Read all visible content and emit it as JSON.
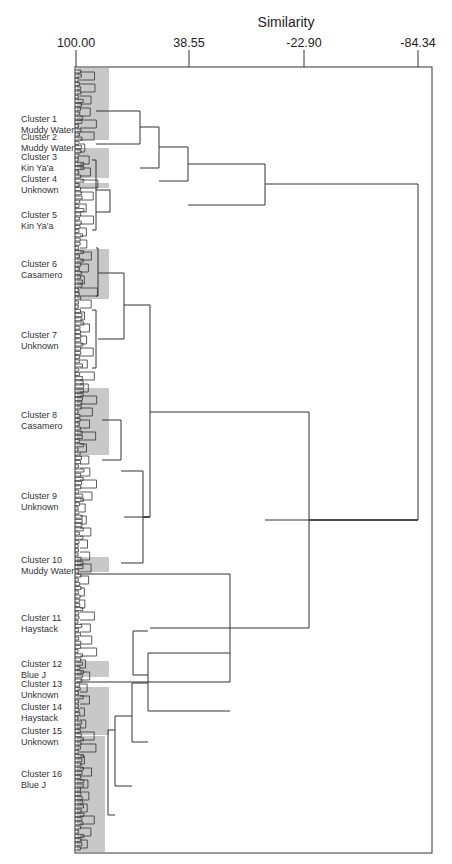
{
  "chart_data": {
    "type": "dendrogram",
    "title": "Similarity",
    "xlabel": "Similarity",
    "ylabel": "",
    "x_axis": {
      "ticks": [
        100.0,
        38.55,
        -22.9,
        -84.34
      ],
      "tick_labels": [
        "100.00",
        "38.55",
        "-22.90",
        "-84.34"
      ],
      "range": [
        100.0,
        -101.0
      ]
    },
    "grid": false,
    "legend": null,
    "clusters": [
      {
        "id": 1,
        "label": "Cluster 1",
        "group": "Muddy Water",
        "shaded": true
      },
      {
        "id": 2,
        "label": "Cluster 2",
        "group": "Muddy Water",
        "shaded": false
      },
      {
        "id": 3,
        "label": "Cluster 3",
        "group": "Kin Ya'a",
        "shaded": true
      },
      {
        "id": 4,
        "label": "Cluster 4",
        "group": "Unknown",
        "shaded": true
      },
      {
        "id": 5,
        "label": "Cluster 5",
        "group": "Kin Ya'a",
        "shaded": false
      },
      {
        "id": 6,
        "label": "Cluster 6",
        "group": "Casamero",
        "shaded": true
      },
      {
        "id": 7,
        "label": "Cluster 7",
        "group": "Unknown",
        "shaded": false
      },
      {
        "id": 8,
        "label": "Cluster 8",
        "group": "Casamero",
        "shaded": true
      },
      {
        "id": 9,
        "label": "Cluster 9",
        "group": "Unknown",
        "shaded": false
      },
      {
        "id": 10,
        "label": "Cluster 10",
        "group": "Muddy Water",
        "shaded": true
      },
      {
        "id": 11,
        "label": "Cluster 11",
        "group": "Haystack",
        "shaded": false
      },
      {
        "id": 12,
        "label": "Cluster 12",
        "group": "Blue J",
        "shaded": true
      },
      {
        "id": 13,
        "label": "Cluster 13",
        "group": "Unknown",
        "shaded": false
      },
      {
        "id": 14,
        "label": "Cluster 14",
        "group": "Haystack",
        "shaded": true
      },
      {
        "id": 15,
        "label": "Cluster 15",
        "group": "Unknown",
        "shaded": false
      },
      {
        "id": 16,
        "label": "Cluster 16",
        "group": "Blue J",
        "shaded": true
      }
    ],
    "major_merges_similarity_approx": [
      {
        "join": "C1+C2",
        "similarity": 65
      },
      {
        "join": "(C1,C2)+C3",
        "similarity": 55
      },
      {
        "join": "+C4",
        "similarity": 39
      },
      {
        "join": "+C5 group",
        "similarity": -3
      },
      {
        "join": "C6+C7",
        "similarity": 74
      },
      {
        "join": "C8+C9",
        "similarity": 74
      },
      {
        "join": "(C8,C9)+C10",
        "similarity": 64
      },
      {
        "join": "(C6,C7)+(C8..C10)",
        "similarity": 60
      },
      {
        "join": "C11+C12",
        "similarity": 67
      },
      {
        "join": "C13..C16",
        "similarity": 70
      },
      {
        "join": "(C11,C12)+(C13..C16)",
        "similarity": 60
      },
      {
        "join": "(C6..C10)+(C11..C16)",
        "similarity": 20
      },
      {
        "join": "lower+(C13..C16 group)",
        "similarity": -26
      },
      {
        "join": "root",
        "similarity": -84
      }
    ]
  },
  "labels": [
    {
      "line1": "Cluster 1",
      "line2": "Muddy Water",
      "y": 114
    },
    {
      "line1": "Cluster 2",
      "line2": "Muddy Water",
      "y": 132
    },
    {
      "line1": "Cluster 3",
      "line2": "Kin Ya'a",
      "y": 152
    },
    {
      "line1": "Cluster 4",
      "line2": "Unknown",
      "y": 174
    },
    {
      "line1": "Cluster 5",
      "line2": "Kin Ya'a",
      "y": 210
    },
    {
      "line1": "Cluster 6",
      "line2": "Casamero",
      "y": 259
    },
    {
      "line1": "Cluster 7",
      "line2": "Unknown",
      "y": 330
    },
    {
      "line1": "Cluster 8",
      "line2": "Casamero",
      "y": 410
    },
    {
      "line1": "Cluster 9",
      "line2": "Unknown",
      "y": 491
    },
    {
      "line1": "Cluster 10",
      "line2": "Muddy Water",
      "y": 555
    },
    {
      "line1": "Cluster 11",
      "line2": "Haystack",
      "y": 613
    },
    {
      "line1": "Cluster 12",
      "line2": "Blue J",
      "y": 659
    },
    {
      "line1": "Cluster 13",
      "line2": "Unknown",
      "y": 679
    },
    {
      "line1": "Cluster 14",
      "line2": "Haystack",
      "y": 702
    },
    {
      "line1": "Cluster 15",
      "line2": "Unknown",
      "y": 726
    },
    {
      "line1": "Cluster 16",
      "line2": "Blue J",
      "y": 769
    }
  ],
  "ticks_px": [
    {
      "label": "100.00",
      "x": 76
    },
    {
      "label": "38.55",
      "x": 189
    },
    {
      "label": "-22.90",
      "x": 304
    },
    {
      "label": "-84.34",
      "x": 418
    }
  ],
  "shades": [
    [
      77,
      68,
      32,
      72
    ],
    [
      77,
      148,
      32,
      30
    ],
    [
      77,
      183,
      32,
      5
    ],
    [
      77,
      249,
      32,
      50
    ],
    [
      77,
      388,
      32,
      67
    ],
    [
      77,
      557,
      32,
      15
    ],
    [
      77,
      661,
      32,
      16
    ],
    [
      77,
      687,
      32,
      48
    ],
    [
      77,
      736,
      28,
      116
    ]
  ],
  "links": [
    [
      140,
      111,
      144,
      96
    ],
    [
      159,
      127,
      168,
      140
    ],
    [
      188,
      147,
      181,
      159
    ],
    [
      265,
      164,
      205,
      188
    ],
    [
      418,
      184,
      520,
      265
    ],
    [
      110,
      190,
      212,
      96
    ],
    [
      96,
      160,
      230,
      92
    ],
    [
      124,
      273,
      339,
      98
    ],
    [
      150,
      305,
      517,
      124
    ],
    [
      98,
      248,
      296,
      96
    ],
    [
      96,
      310,
      368,
      92
    ],
    [
      121,
      420,
      460,
      102
    ],
    [
      143,
      471,
      563,
      121
    ],
    [
      150,
      517,
      517,
      143
    ],
    [
      309,
      412,
      628,
      150
    ],
    [
      418,
      520,
      520,
      309
    ],
    [
      230,
      574,
      682,
      77
    ],
    [
      148,
      653,
      711,
      230
    ],
    [
      133,
      631,
      675,
      148
    ],
    [
      132,
      683,
      742,
      148
    ],
    [
      115,
      716,
      786,
      132
    ],
    [
      108,
      730,
      815,
      115
    ]
  ],
  "colors": {
    "shade": "#c8c8c8",
    "line": "#333333",
    "frame": "#333333"
  }
}
